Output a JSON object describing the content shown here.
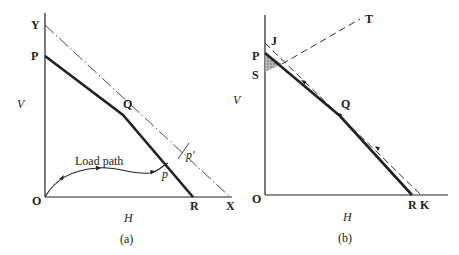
{
  "panel_a": {
    "caption": "(a)",
    "axis_y_label": "V",
    "axis_x_label": "H",
    "points": {
      "origin": "O",
      "y_intercept_dashdot": "Y",
      "y_intercept_solid": "P",
      "intersection": "Q",
      "x_intercept_solid": "R",
      "x_intercept_dashdot": "X",
      "load_point": "p",
      "load_point_prime": "p′"
    },
    "curve_label": "Load path"
  },
  "panel_b": {
    "caption": "(b)",
    "axis_y_label": "V",
    "axis_x_label": "H",
    "points": {
      "origin": "O",
      "dashed_top": "J",
      "solid_top": "P",
      "shaded_corner": "S",
      "dashed_end": "T",
      "midpoint": "Q",
      "x_intercept_solid": "R",
      "x_intercept_dashed": "K"
    }
  }
}
